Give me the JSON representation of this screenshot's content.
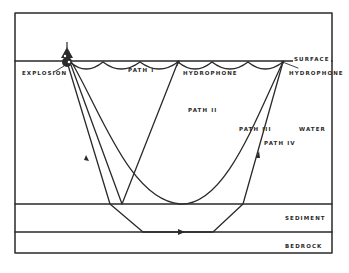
{
  "diagram": {
    "type": "seismic-refraction-paths",
    "colors": {
      "line": "#2a2a2a",
      "background": "#ffffff"
    },
    "labels": {
      "explosion": "EXPLOSION",
      "surface": "SURFACE",
      "hydrophone_1": "HYDROPHONE",
      "hydrophone_2": "HYDROPHONE",
      "path_1": "PATH I",
      "path_2": "PATH II",
      "path_3": "PATH III",
      "path_4": "PATH IV",
      "water": "WATER",
      "sediment": "SEDIMENT",
      "bedrock": "BEDROCK"
    },
    "layers": [
      "WATER",
      "SEDIMENT",
      "BEDROCK"
    ],
    "nodes": [
      {
        "id": "explosion",
        "label": "EXPLOSION"
      },
      {
        "id": "hydrophone-1",
        "label": "HYDROPHONE"
      },
      {
        "id": "hydrophone-2",
        "label": "HYDROPHONE"
      }
    ],
    "paths": [
      {
        "id": "path-1",
        "label": "PATH I",
        "description": "surface-reflected scalloped path"
      },
      {
        "id": "path-2",
        "label": "PATH II",
        "description": "bottom reflection to first hydrophone"
      },
      {
        "id": "path-3",
        "label": "PATH III",
        "description": "curved refracted water path"
      },
      {
        "id": "path-4",
        "label": "PATH IV",
        "description": "refracted along bedrock"
      }
    ]
  }
}
